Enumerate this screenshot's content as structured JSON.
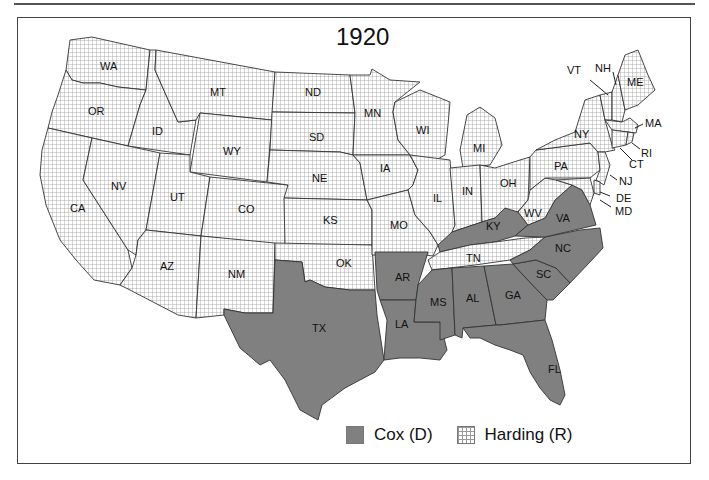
{
  "map": {
    "title": "1920",
    "colors": {
      "cox": "#808080",
      "harding_grid": "#999999",
      "harding_bg": "#ffffff",
      "border": "#333333"
    },
    "legend": [
      {
        "party": "cox",
        "label": "Cox (D)"
      },
      {
        "party": "harding",
        "label": "Harding (R)"
      }
    ],
    "states": {
      "WA": "harding",
      "OR": "harding",
      "CA": "harding",
      "ID": "harding",
      "NV": "harding",
      "MT": "harding",
      "WY": "harding",
      "UT": "harding",
      "AZ": "harding",
      "CO": "harding",
      "NM": "harding",
      "ND": "harding",
      "SD": "harding",
      "NE": "harding",
      "KS": "harding",
      "OK": "harding",
      "MN": "harding",
      "IA": "harding",
      "MO": "harding",
      "WI": "harding",
      "IL": "harding",
      "MI": "harding",
      "IN": "harding",
      "OH": "harding",
      "WV": "harding",
      "PA": "harding",
      "NY": "harding",
      "VT": "harding",
      "NH": "harding",
      "ME": "harding",
      "MA": "harding",
      "RI": "harding",
      "CT": "harding",
      "NJ": "harding",
      "DE": "harding",
      "MD": "harding",
      "TN": "harding",
      "TX": "cox",
      "AR": "cox",
      "LA": "cox",
      "MS": "cox",
      "AL": "cox",
      "GA": "cox",
      "FL": "cox",
      "SC": "cox",
      "NC": "cox",
      "VA": "cox",
      "KY": "cox"
    },
    "labels": {
      "WA": "WA",
      "OR": "OR",
      "CA": "CA",
      "ID": "ID",
      "NV": "NV",
      "MT": "MT",
      "WY": "WY",
      "UT": "UT",
      "AZ": "AZ",
      "CO": "CO",
      "NM": "NM",
      "ND": "ND",
      "SD": "SD",
      "NE": "NE",
      "KS": "KS",
      "OK": "OK",
      "TX": "TX",
      "MN": "MN",
      "IA": "IA",
      "MO": "MO",
      "AR": "AR",
      "LA": "LA",
      "WI": "WI",
      "IL": "IL",
      "MI": "MI",
      "IN": "IN",
      "OH": "OH",
      "KY": "KY",
      "TN": "TN",
      "MS": "MS",
      "AL": "AL",
      "GA": "GA",
      "FL": "FL",
      "SC": "SC",
      "NC": "NC",
      "VA": "VA",
      "WV": "WV",
      "PA": "PA",
      "NY": "NY",
      "VT": "VT",
      "NH": "NH",
      "ME": "ME",
      "MA": "MA",
      "RI": "RI",
      "CT": "CT",
      "NJ": "NJ",
      "DE": "DE",
      "MD": "MD"
    }
  }
}
